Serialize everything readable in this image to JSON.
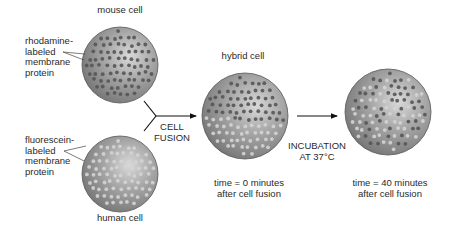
{
  "cells": {
    "mouse": {
      "title": "mouse cell",
      "center": [
        120,
        65
      ],
      "radius": 38,
      "label_lines": [
        "rhodamine-",
        "labeled",
        "membrane",
        "protein"
      ],
      "dot_color": "#555555"
    },
    "human": {
      "title": "human cell",
      "center": [
        120,
        174
      ],
      "radius": 38,
      "label_lines": [
        "fluorescein-",
        "labeled",
        "membrane",
        "protein"
      ],
      "dot_color": "#d4d4d4"
    },
    "hybrid": {
      "title": "hybrid cell",
      "center": [
        245,
        116
      ],
      "radius": 43,
      "caption_lines": [
        "time = 0 minutes",
        "after cell fusion"
      ]
    },
    "mixed": {
      "center": [
        388,
        112
      ],
      "radius": 43,
      "caption_lines": [
        "time = 40 minutes",
        "after cell fusion"
      ]
    }
  },
  "steps": {
    "fusion": {
      "lines": [
        "CELL",
        "FUSION"
      ]
    },
    "incubation": {
      "lines": [
        "INCUBATION",
        "AT 37°C"
      ]
    }
  },
  "colors": {
    "membrane_base": "#8e8e8e",
    "membrane_highlight": "#d8d8d8",
    "membrane_edge": "#5a5a5a",
    "rhodamine_dot": "#555555",
    "fluorescein_dot": "#d4d4d4",
    "arrow": "#111111"
  }
}
